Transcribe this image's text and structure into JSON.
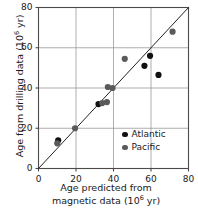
{
  "chart_data": {
    "type": "scatter",
    "title": "",
    "xlabel": "Age predicted from magnetic data (10^6 yr)",
    "xlabel_line1": "Age predicted from",
    "xlabel_line2_prefix": "magnetic data (10",
    "xlabel_line2_exp": "6",
    "xlabel_line2_suffix": " yr)",
    "ylabel": "Age from drilling data (10^6 yr)",
    "ylabel_prefix": "Age from drilling data (10",
    "ylabel_exp": "6",
    "ylabel_suffix": " yr)",
    "xlim": [
      0,
      80
    ],
    "ylim": [
      0,
      80
    ],
    "xticks": [
      0,
      20,
      40,
      60,
      80
    ],
    "yticks": [
      0,
      20,
      40,
      60,
      80
    ],
    "xtick_labels": [
      "0",
      "20",
      "40",
      "60",
      "80"
    ],
    "ytick_labels": [
      "0",
      "20",
      "40",
      "60",
      "80"
    ],
    "grid": true,
    "grid_color": "#999999",
    "frame": true,
    "legend_position": "lower right",
    "reference_line": {
      "name": "one-to-one-line",
      "from": [
        0,
        0
      ],
      "to": [
        80,
        80
      ],
      "color": "#222222"
    },
    "series": [
      {
        "name": "Atlantic",
        "color": "#111111",
        "marker": "circle",
        "points": [
          [
            10.5,
            14.0
          ],
          [
            32.0,
            32.0
          ],
          [
            56.5,
            51.0
          ],
          [
            59.5,
            56.0
          ],
          [
            64.0,
            46.5
          ]
        ]
      },
      {
        "name": "Pacific",
        "color": "#5a5a5a",
        "marker": "circle",
        "points": [
          [
            10.0,
            12.5
          ],
          [
            19.5,
            20.0
          ],
          [
            34.0,
            32.5
          ],
          [
            36.5,
            33.0
          ],
          [
            37.0,
            40.5
          ],
          [
            39.5,
            40.0
          ],
          [
            46.0,
            54.5
          ],
          [
            71.5,
            68.0
          ]
        ]
      }
    ]
  },
  "legend": {
    "entries": [
      {
        "label": "Atlantic",
        "color": "#111111"
      },
      {
        "label": "Pacific",
        "color": "#5a5a5a"
      }
    ]
  }
}
